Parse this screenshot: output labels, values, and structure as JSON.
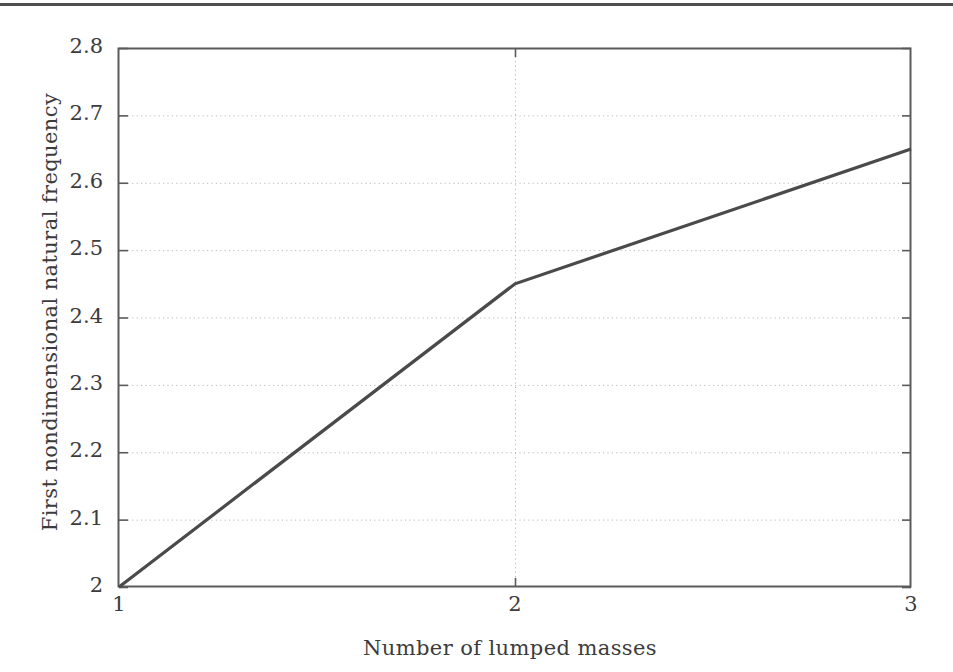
{
  "figure": {
    "page_rule": "horizontal-rule",
    "background_color": "#ffffff",
    "line_color": "#4a4a4a",
    "axis_color": "#5a5a5a",
    "grid_color": "#b9b9b9"
  },
  "chart_data": {
    "type": "line",
    "title": "",
    "xlabel": "Number of lumped masses",
    "ylabel": "First nondimensional natural frequency",
    "x": [
      1,
      2,
      3
    ],
    "values": [
      2.0,
      2.45,
      2.65
    ],
    "series": [
      {
        "name": "First nondimensional natural frequency",
        "values": [
          2.0,
          2.45,
          2.65
        ]
      }
    ],
    "xlim": [
      1,
      3
    ],
    "ylim": [
      2,
      2.8
    ],
    "xticks": [
      1,
      2,
      3
    ],
    "xtick_labels": [
      "1",
      "2",
      "3"
    ],
    "yticks": [
      2,
      2.1,
      2.2,
      2.3,
      2.4,
      2.5,
      2.6,
      2.7,
      2.8
    ],
    "ytick_labels": [
      "2",
      "2.1",
      "2.2",
      "2.3",
      "2.4",
      "2.5",
      "2.6",
      "2.7",
      "2.8"
    ],
    "grid": true,
    "grid_style": "dotted",
    "legend": null,
    "legend_position": "none",
    "annotations": []
  }
}
